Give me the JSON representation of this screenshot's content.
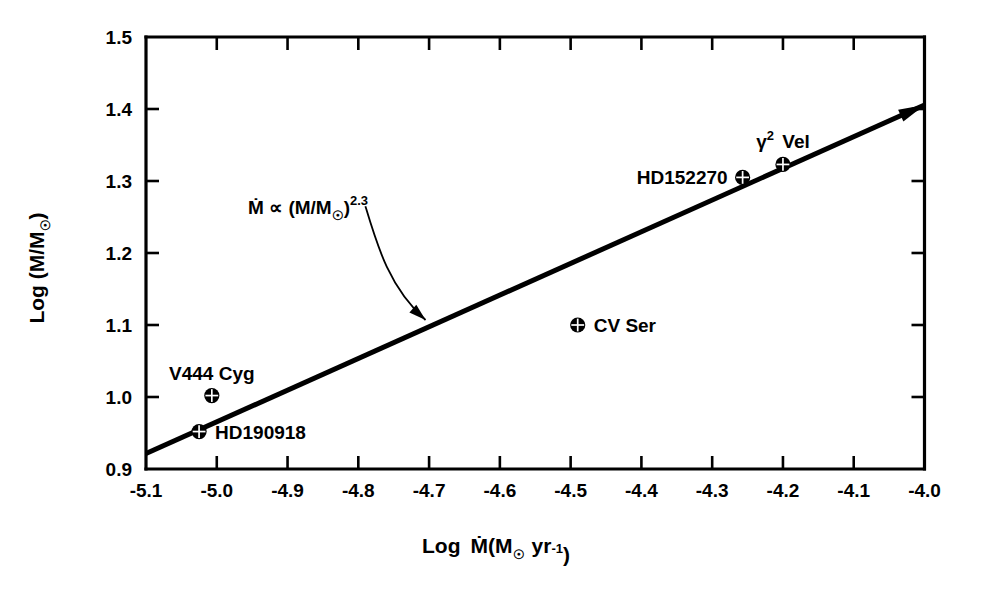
{
  "chart_data": {
    "type": "scatter",
    "title": "",
    "xlabel": "Log Ṁ(M☉ yr⁻¹)",
    "ylabel": "Log (M/M☉)",
    "xlim": [
      -5.1,
      -4.0
    ],
    "ylim": [
      0.9,
      1.5
    ],
    "xticks": [
      -5.1,
      -5.0,
      -4.9,
      -4.8,
      -4.7,
      -4.6,
      -4.5,
      -4.4,
      -4.3,
      -4.2,
      -4.1,
      -4.0
    ],
    "xtick_labels": [
      "-5.1",
      "-5.0",
      "-4.9",
      "-4.8",
      "-4.7",
      "-4.6",
      "-4.5",
      "-4.4",
      "-4.3",
      "-4.2",
      "-4.1",
      "-4.0"
    ],
    "yticks": [
      0.9,
      1.0,
      1.1,
      1.2,
      1.3,
      1.4,
      1.5
    ],
    "ytick_labels": [
      "0.9",
      "1.0",
      "1.1",
      "1.2",
      "1.3",
      "1.4",
      "1.5"
    ],
    "grid": false,
    "legend": "none",
    "points": [
      {
        "name": "HD190918",
        "x": -5.025,
        "y": 0.952,
        "label": "HD190918",
        "label_pos": "right"
      },
      {
        "name": "V444 Cyg",
        "x": -5.007,
        "y": 1.002,
        "label": "V444 Cyg",
        "label_pos": "above"
      },
      {
        "name": "CV Ser",
        "x": -4.49,
        "y": 1.1,
        "label": "CV Ser",
        "label_pos": "right"
      },
      {
        "name": "HD152270",
        "x": -4.257,
        "y": 1.305,
        "label": "HD152270",
        "label_pos": "left"
      },
      {
        "name": "gamma2 Vel",
        "x": -4.2,
        "y": 1.323,
        "label": "γ² Vel",
        "label_pos": "above"
      }
    ],
    "fit_line": {
      "label": "Ṁ ∝ (M/M☉)^2.3",
      "label_base": "Ṁ ∝ (M/M",
      "label_sub": "☉",
      "label_close": ")",
      "label_exp": "2.3",
      "slope_exponent": 2.3,
      "x_start": -5.1,
      "y_start": 0.9215,
      "x_end": -4.0,
      "y_end": 1.4055
    },
    "annotation_arrow": {
      "from_x": -4.79,
      "from_y": 1.265,
      "to_x": -4.705,
      "to_y": 1.107
    }
  },
  "axis_titles": {
    "x_prefix": "Log",
    "x_mdot": "Ṁ(M",
    "x_sun": "☉",
    "x_yr": "yr",
    "x_exp": "-1",
    "x_close": ")",
    "y_text": "Log (M/M",
    "y_sun": "☉",
    "y_close": ")"
  }
}
